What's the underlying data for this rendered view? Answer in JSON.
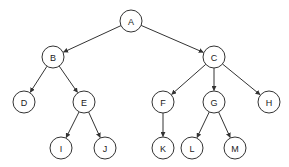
{
  "diagram": {
    "type": "tree",
    "title": "",
    "colors": {
      "stroke": "#333333",
      "fill": "#ffffff",
      "text": "#222222"
    },
    "node_radius": 11,
    "nodes": [
      {
        "id": "A",
        "label": "A",
        "x": 131,
        "y": 21
      },
      {
        "id": "B",
        "label": "B",
        "x": 53,
        "y": 57
      },
      {
        "id": "C",
        "label": "C",
        "x": 214,
        "y": 57
      },
      {
        "id": "D",
        "label": "D",
        "x": 24,
        "y": 102
      },
      {
        "id": "E",
        "label": "E",
        "x": 84,
        "y": 102
      },
      {
        "id": "F",
        "label": "F",
        "x": 163,
        "y": 102
      },
      {
        "id": "G",
        "label": "G",
        "x": 214,
        "y": 102
      },
      {
        "id": "H",
        "label": "H",
        "x": 269,
        "y": 102
      },
      {
        "id": "I",
        "label": "I",
        "x": 61,
        "y": 148
      },
      {
        "id": "J",
        "label": "J",
        "x": 105,
        "y": 148
      },
      {
        "id": "K",
        "label": "K",
        "x": 163,
        "y": 148
      },
      {
        "id": "L",
        "label": "L",
        "x": 192,
        "y": 148
      },
      {
        "id": "M",
        "label": "M",
        "x": 235,
        "y": 148
      }
    ],
    "edges": [
      {
        "from": "A",
        "to": "B"
      },
      {
        "from": "A",
        "to": "C"
      },
      {
        "from": "B",
        "to": "D"
      },
      {
        "from": "B",
        "to": "E"
      },
      {
        "from": "C",
        "to": "F"
      },
      {
        "from": "C",
        "to": "G"
      },
      {
        "from": "C",
        "to": "H"
      },
      {
        "from": "E",
        "to": "I"
      },
      {
        "from": "E",
        "to": "J"
      },
      {
        "from": "F",
        "to": "K"
      },
      {
        "from": "G",
        "to": "L"
      },
      {
        "from": "G",
        "to": "M"
      }
    ]
  }
}
